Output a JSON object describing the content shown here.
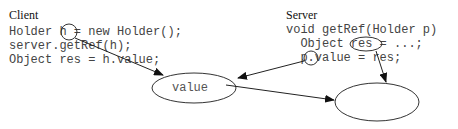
{
  "client": {
    "heading": "Client",
    "lines": [
      "Holder h = new Holder();",
      "server.getRef(h);",
      "Object res = h.value;"
    ]
  },
  "server": {
    "heading": "Server",
    "lines": [
      "void getRef(Holder p)",
      "  Object res = ...;",
      "  p.value = res;"
    ]
  },
  "nodes": {
    "holder_object": {
      "label": "value"
    },
    "result_object": {
      "label": ""
    }
  },
  "highlighted_vars": [
    "h",
    "res",
    "p"
  ]
}
